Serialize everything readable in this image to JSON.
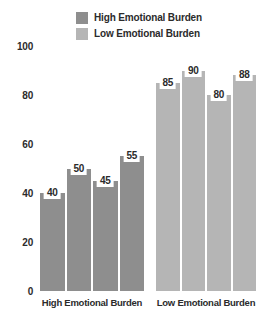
{
  "chart_data": {
    "type": "bar",
    "title": "",
    "subtitle": "",
    "xlabel": "",
    "ylabel": "",
    "ylim": [
      0,
      100
    ],
    "yticks": [
      "0",
      "20",
      "40",
      "60",
      "80",
      "100"
    ],
    "grid": false,
    "legend_position": "top-center",
    "categories": [
      "High Emotional Burden",
      "Low Emotional Burden"
    ],
    "legend": [
      {
        "name": "High Emotional Burden",
        "color": "#8e8e8e"
      },
      {
        "name": "Low Emotional Burden",
        "color": "#b5b5b5"
      }
    ],
    "groups": [
      {
        "category": "High Emotional Burden",
        "color": "#8e8e8e",
        "values": [
          40,
          50,
          45,
          55
        ]
      },
      {
        "category": "Low Emotional Burden",
        "color": "#b5b5b5",
        "values": [
          85,
          90,
          80,
          88
        ]
      }
    ]
  }
}
